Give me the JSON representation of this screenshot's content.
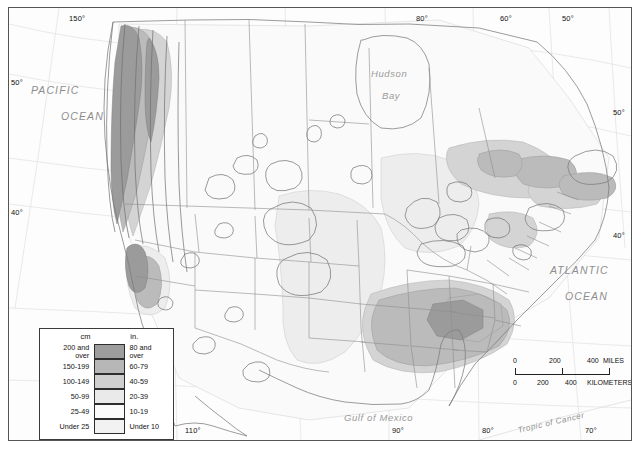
{
  "map": {
    "title": "Average Annual Precipitation - North America",
    "type": "choropleth-isoline-map",
    "projection": "conic",
    "frame_color": "#555555",
    "background_color": "#fdfdfd"
  },
  "graticule": {
    "top_labels": [
      {
        "text": "150°",
        "x": 60,
        "y": 6
      },
      {
        "text": "80°",
        "x": 407,
        "y": 6
      },
      {
        "text": "60°",
        "x": 491,
        "y": 6
      },
      {
        "text": "50°",
        "x": 553,
        "y": 6
      }
    ],
    "bottom_labels": [
      {
        "text": "110°",
        "x": 176,
        "y": 418
      },
      {
        "text": "90°",
        "x": 383,
        "y": 418
      },
      {
        "text": "80°",
        "x": 473,
        "y": 418
      },
      {
        "text": "70°",
        "x": 576,
        "y": 418
      }
    ],
    "left_labels": [
      {
        "text": "50°",
        "x": 2,
        "y": 70
      },
      {
        "text": "40°",
        "x": 2,
        "y": 200
      }
    ],
    "right_labels": [
      {
        "text": "50°",
        "x": 606,
        "y": 100
      },
      {
        "text": "40°",
        "x": 606,
        "y": 223
      }
    ]
  },
  "water_labels": [
    {
      "name": "pacific-ocean-label",
      "line1": "PACIFIC",
      "line2": "OCEAN",
      "x": 30,
      "y": 82,
      "x2": 60,
      "y2": 108
    },
    {
      "name": "atlantic-ocean-label",
      "line1": "ATLANTIC",
      "line2": "OCEAN",
      "x": 549,
      "y": 262,
      "x2": 564,
      "y2": 288
    },
    {
      "name": "hudson-bay-label",
      "line1": "Hudson",
      "line2": "Bay",
      "x": 370,
      "y": 65,
      "x2": 381,
      "y2": 87
    },
    {
      "name": "gulf-of-mexico-label",
      "line1": "Gulf  of  Mexico",
      "x": 343,
      "y": 410
    },
    {
      "name": "tropic-of-cancer-label",
      "line1": "Tropic of Cancer",
      "x": 516,
      "y": 420
    }
  ],
  "legend": {
    "name": "precipitation-legend",
    "header_cm": "cm",
    "header_in": "in.",
    "rows": [
      {
        "cm": "200 and over",
        "cm_line1": "200 and",
        "cm_line2": "over",
        "in": "80 and over",
        "in_line1": "80 and",
        "in_line2": "over",
        "color": "#9d9d9d"
      },
      {
        "cm": "150-199",
        "in": "60-79",
        "color": "#b7b7b7"
      },
      {
        "cm": "100-149",
        "in": "40-59",
        "color": "#cfcfcf"
      },
      {
        "cm": "50-99",
        "in": "20-39",
        "color": "#eaeaea"
      },
      {
        "cm": "25-49",
        "in": "10-19",
        "color": "#fbfbfb"
      },
      {
        "cm": "Under 25",
        "in": "Under 10",
        "color": "#f2f2f2"
      }
    ]
  },
  "scale": {
    "name": "map-scale-bar",
    "miles": {
      "ticks": [
        "0",
        "200",
        "400"
      ],
      "unit": "MILES"
    },
    "kilometers": {
      "ticks": [
        "0",
        "200",
        "400"
      ],
      "unit": "KILOMETERS"
    }
  },
  "colors": {
    "class_200_over": "#9d9d9d",
    "class_150_199": "#b7b7b7",
    "class_100_149": "#cfcfcf",
    "class_50_99": "#eaeaea",
    "class_25_49": "#fbfbfb",
    "class_under_25": "#f2f2f2",
    "coastline": "#777777",
    "border": "#8a8a8a",
    "graticule": "#e2e2e2"
  }
}
